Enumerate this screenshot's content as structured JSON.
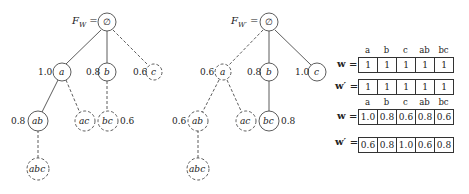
{
  "left_tree": {
    "root_label": "F",
    "root_sub": "W",
    "root_eq": " =",
    "root_node": "∅",
    "nodes": [
      {
        "id": "a",
        "text": "a",
        "weight": "1.0",
        "style": "solid"
      },
      {
        "id": "b",
        "text": "b",
        "weight": "0.8",
        "style": "solid"
      },
      {
        "id": "c",
        "text": "c",
        "weight": "0.6",
        "style": "dashed"
      },
      {
        "id": "ab",
        "text": "ab",
        "weight": "0.8",
        "style": "solid"
      },
      {
        "id": "ac",
        "text": "ac",
        "weight": "",
        "style": "dashed"
      },
      {
        "id": "bc",
        "text": "bc",
        "weight": "0.6",
        "style": "dashed"
      },
      {
        "id": "abc",
        "text": "abc",
        "weight": "",
        "style": "dashed"
      }
    ]
  },
  "right_tree": {
    "root_label": "F",
    "root_sub": "W′",
    "root_eq": " =",
    "root_node": "∅",
    "nodes": [
      {
        "id": "a",
        "text": "a",
        "weight": "0.6",
        "style": "dashed"
      },
      {
        "id": "b",
        "text": "b",
        "weight": "0.8",
        "style": "solid"
      },
      {
        "id": "c",
        "text": "c",
        "weight": "1.0",
        "style": "solid"
      },
      {
        "id": "ab",
        "text": "ab",
        "weight": "0.6",
        "style": "dashed"
      },
      {
        "id": "ac",
        "text": "ac",
        "weight": "",
        "style": "dashed"
      },
      {
        "id": "bc",
        "text": "bc",
        "weight": "0.8",
        "style": "solid"
      },
      {
        "id": "abc",
        "text": "abc",
        "weight": "",
        "style": "dashed"
      }
    ]
  },
  "tables": [
    {
      "headers": [
        "a",
        "b",
        "c",
        "ab",
        "bc"
      ],
      "rows": [
        {
          "label": "w =",
          "values": [
            "1",
            "1",
            "1",
            "1",
            "1"
          ]
        },
        {
          "label": "w′ =",
          "values": [
            "1",
            "1",
            "1",
            "1",
            "1"
          ]
        }
      ]
    },
    {
      "headers": [
        "a",
        "b",
        "c",
        "ab",
        "bc"
      ],
      "rows": [
        {
          "label": "w =",
          "values": [
            "1.0",
            "0.8",
            "0.6",
            "0.8",
            "0.6"
          ]
        },
        {
          "label": "w′ =",
          "values": [
            "0.6",
            "0.8",
            "1.0",
            "0.6",
            "0.8"
          ]
        }
      ]
    }
  ]
}
